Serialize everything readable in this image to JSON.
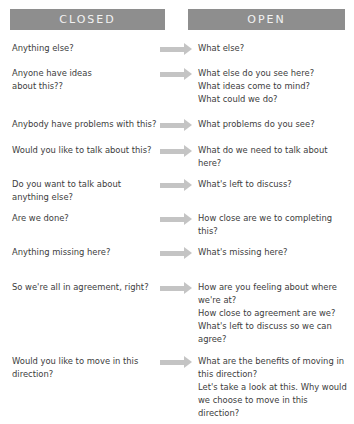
{
  "headers": {
    "closed": "CLOSED",
    "open": "OPEN"
  },
  "colors": {
    "header_bg": "#8e8e8e",
    "header_text": "#f2f2f2",
    "arrow": "#c4c4c4",
    "body_text": "#3c3c3c"
  },
  "rows": [
    {
      "closed": "Anything else?",
      "open": [
        "What else?"
      ]
    },
    {
      "closed": "Anyone have ideas about this??",
      "open": [
        "What else do you see here?",
        "What ideas come to mind?",
        "What could we do?"
      ]
    },
    {
      "closed": "Anybody have problems with this?",
      "open": [
        "What problems do you see?"
      ]
    },
    {
      "closed": "Would you like to talk about this?",
      "open": [
        "What do we need to talk about here?"
      ]
    },
    {
      "closed": "Do you want to talk about anything else?",
      "open": [
        "What's left to discuss?"
      ]
    },
    {
      "closed": "Are we done?",
      "open": [
        "How close are we to completing this?"
      ]
    },
    {
      "closed": "Anything missing here?",
      "open": [
        "What's missing here?"
      ]
    },
    {
      "closed": "So we're all in agreement, right?",
      "open": [
        "How are you feeling about where we're at?",
        "How close to agreement are we?",
        "What's left to discuss so we can agree?"
      ]
    },
    {
      "closed": "Would you like to move in this direction?",
      "open": [
        "What are the benefits of moving in this direction?",
        "Let's take a look at this. Why would we choose to move in this direction?"
      ]
    }
  ]
}
